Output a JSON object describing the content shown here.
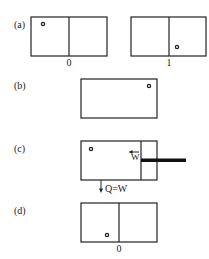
{
  "panels": [
    {
      "id": "a",
      "label": "(a)",
      "states": [
        {
          "caption": "0",
          "particle": "left-chamber-top-left"
        },
        {
          "caption": "1",
          "particle": "right-chamber-bottom-left"
        }
      ]
    },
    {
      "id": "b",
      "label": "(b)",
      "states": [
        {
          "caption": "",
          "particle": "single-chamber-top-right"
        }
      ]
    },
    {
      "id": "c",
      "label": "(c)",
      "work_label": "W",
      "heat_label": "Q=W",
      "states": [
        {
          "caption": "",
          "particle": "top-left",
          "piston": "right-side"
        }
      ]
    },
    {
      "id": "d",
      "label": "(d)",
      "states": [
        {
          "caption": "0",
          "particle": "left-chamber-bottom-right"
        }
      ]
    }
  ],
  "colors": {
    "stroke": "#222222",
    "background": "#ffffff"
  }
}
